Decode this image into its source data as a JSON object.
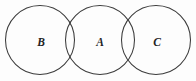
{
  "figure": {
    "type": "venn-three-circle-chain",
    "title": "",
    "caption": "",
    "background_color": "#fdfdfd",
    "stroke_color": "#3b3b3b",
    "label_color": "#232323",
    "canvas": {
      "width": 196,
      "height": 81
    }
  },
  "circles": [
    {
      "id": "circle-b",
      "label": "B",
      "center_x": 40,
      "center_y": 40,
      "radius": 34.5,
      "label_x": 41,
      "label_y": 41
    },
    {
      "id": "circle-a",
      "label": "A",
      "center_x": 100,
      "center_y": 40,
      "radius": 34.5,
      "label_x": 100,
      "label_y": 41
    },
    {
      "id": "circle-c",
      "label": "C",
      "center_x": 156,
      "center_y": 40,
      "radius": 34.5,
      "label_x": 157,
      "label_y": 41
    }
  ],
  "intersections": [
    {
      "id": "intersection-b-a",
      "between": "B and A",
      "x": 72.5,
      "y_top": 20,
      "y_bottom": 60
    },
    {
      "id": "intersection-a-c",
      "between": "A and C",
      "x": 128,
      "y_top": 20,
      "y_bottom": 60
    }
  ]
}
